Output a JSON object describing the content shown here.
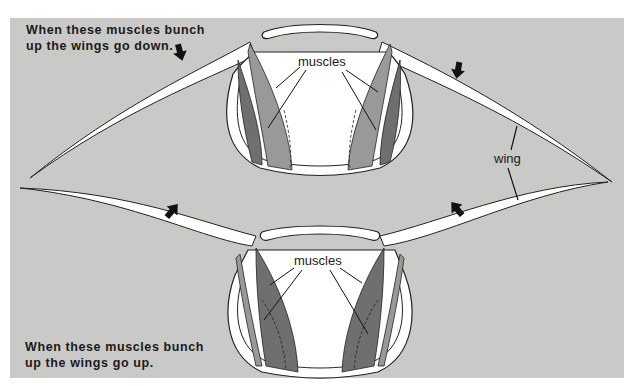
{
  "diagram": {
    "top_caption_line1": "When these muscles bunch",
    "top_caption_line2": "up the wings go down.",
    "bottom_caption_line1": "When these muscles bunch",
    "bottom_caption_line2": "up the wings go up.",
    "top_muscles_label": "muscles",
    "bottom_muscles_label": "muscles",
    "wing_label": "wing",
    "arrows": [
      {
        "position": "top-left",
        "direction": "down"
      },
      {
        "position": "top-right",
        "direction": "down"
      },
      {
        "position": "bottom-left",
        "direction": "up-right"
      },
      {
        "position": "bottom-right",
        "direction": "up-left"
      }
    ],
    "colors": {
      "background": "#c9c9c7",
      "body_fill": "#ffffff",
      "muscle_dark": "#6f6f6f",
      "muscle_mid": "#999999",
      "outline": "#222222"
    }
  }
}
